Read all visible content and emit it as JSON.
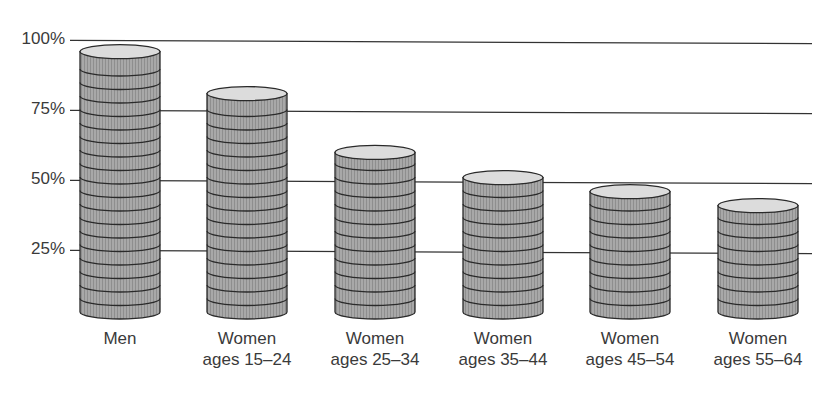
{
  "chart_data": {
    "type": "bar",
    "style": "3d-cylinder-coin-stacks",
    "title": "",
    "xlabel": "",
    "ylabel": "",
    "ylim": [
      0,
      100
    ],
    "yticks": [
      "25%",
      "50%",
      "75%",
      "100%"
    ],
    "ytick_values": [
      25,
      50,
      75,
      100
    ],
    "grid": true,
    "legend": null,
    "categories": [
      [
        "Men"
      ],
      [
        "Women",
        "ages 15–24"
      ],
      [
        "Women",
        "ages 25–34"
      ],
      [
        "Women",
        "ages 35–44"
      ],
      [
        "Women",
        "ages 45–54"
      ],
      [
        "Women",
        "ages 55–64"
      ]
    ],
    "values": [
      98,
      83,
      62,
      53,
      48,
      43
    ],
    "colors": {
      "body": "#a8a8a8",
      "top": "#dcdcdc",
      "outline": "#2a2a2a",
      "grid": "#333333",
      "text": "#3a3a3a"
    }
  }
}
